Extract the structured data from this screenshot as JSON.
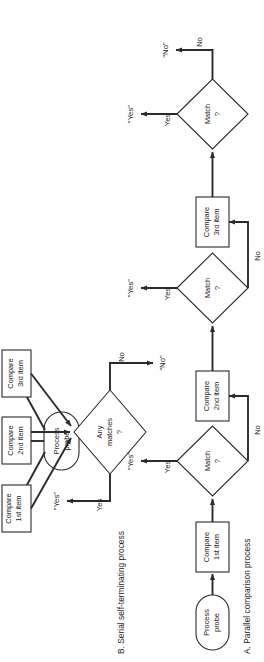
{
  "figure": {
    "orientation": "rotated-90-ccw",
    "background": "#ffffff",
    "ink_color": "#2b2b2b",
    "panels": [
      {
        "id": "A",
        "caption": "A.  Parallel comparison process",
        "nodes": {
          "start": "Process\nprobe",
          "start_line1": "Process",
          "start_line2": "probe",
          "compare1_line1": "Compare",
          "compare1_line2": "1st item",
          "compare2_line1": "Compare",
          "compare2_line2": "2nd item",
          "compare3_line1": "Compare",
          "compare3_line2": "3rd item",
          "decision_line1": "Any",
          "decision_line2": "matches",
          "decision_line3": "?"
        },
        "edge_labels": {
          "yes": "Yes",
          "no": "No"
        },
        "outputs": {
          "yes": "“Yes”",
          "no": "“No”"
        }
      },
      {
        "id": "B",
        "caption": "B.  Serial self-terminating process",
        "nodes": {
          "start_line1": "Process",
          "start_line2": "probe",
          "compare1_line1": "Compare",
          "compare1_line2": "1st item",
          "compare2_line1": "Compare",
          "compare2_line2": "2nd item",
          "compare3_line1": "Compare",
          "compare3_line2": "3rd item",
          "decision1_line1": "Match",
          "decision1_line2": "?",
          "decision2_line1": "Match",
          "decision2_line2": "?",
          "decision3_line1": "Match",
          "decision3_line2": "?"
        },
        "edge_labels": {
          "yes": "Yes",
          "no": "No"
        },
        "outputs": {
          "yes": "“Yes”",
          "no": "“No”"
        }
      }
    ]
  }
}
